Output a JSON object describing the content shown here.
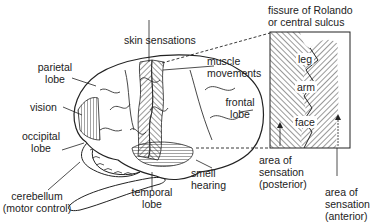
{
  "diagram": {
    "labels": {
      "parietal": [
        "parietal",
        "lobe"
      ],
      "vision": "vision",
      "occipital": [
        "occipital",
        "lobe"
      ],
      "cerebellum": [
        "cerebellum",
        "(motor control)"
      ],
      "skin": "skin sensations",
      "muscle": [
        "muscle",
        "movements"
      ],
      "frontal": [
        "frontal",
        "lobe"
      ],
      "temporal": [
        "temporal",
        "lobe"
      ],
      "smell": [
        "smell",
        "hearing"
      ],
      "fissure": [
        "fissure of Rolando",
        "or central sulcus"
      ],
      "posterior": [
        "area of",
        "sensation",
        "(posterior)"
      ],
      "anterior": [
        "area of",
        "sensation",
        "(anterior)"
      ]
    },
    "inset_regions": [
      "leg",
      "arm",
      "face"
    ],
    "colors": {
      "ink": "#222222",
      "background": "#ffffff"
    }
  }
}
